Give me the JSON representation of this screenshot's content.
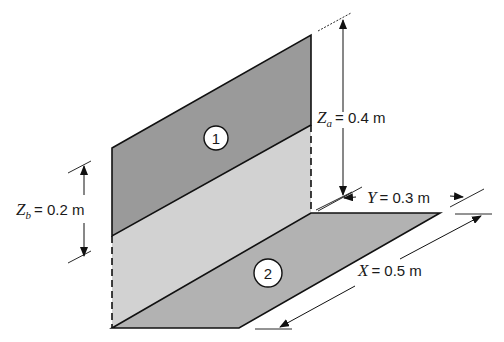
{
  "figure": {
    "type": "isometric geometry diagram of two perpendicular rectangular surfaces",
    "colors": {
      "surface_1": "#9e9e9e",
      "lower_vertical": "#d0d0d0",
      "surface_2": "#b4b4b4",
      "stroke": "#111111",
      "background": "#ffffff"
    }
  },
  "surfaces": [
    {
      "id": "1",
      "label": "1",
      "description": "upper vertical rectangle (dark shaded)"
    },
    {
      "id": "2",
      "label": "2",
      "description": "horizontal floor rectangle (medium shaded)"
    }
  ],
  "dimensions": {
    "za": {
      "var": "Z",
      "sub": "a",
      "value": "= 0.4 m"
    },
    "zb": {
      "var": "Z",
      "sub": "b",
      "value": "= 0.2 m"
    },
    "y": {
      "var": "Y",
      "value": "= 0.3 m"
    },
    "x": {
      "var": "X",
      "value": "= 0.5 m"
    }
  }
}
